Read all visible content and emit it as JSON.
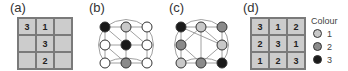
{
  "panels": {
    "a": {
      "label": "(a)",
      "cells": [
        "3",
        "1",
        "",
        "",
        "3",
        "",
        "",
        "2",
        ""
      ]
    },
    "b": {
      "label": "(b)",
      "nodes": [
        "3",
        "1",
        "0",
        "0",
        "3",
        "0",
        "0",
        "2",
        "0"
      ]
    },
    "c": {
      "label": "(c)",
      "nodes": [
        "3",
        "1",
        "2",
        "2",
        "",
        "1",
        "1",
        "2",
        "3"
      ]
    },
    "d": {
      "label": "(d)",
      "cells": [
        "3",
        "1",
        "2",
        "2",
        "3",
        "1",
        "1",
        "2",
        "3"
      ]
    }
  },
  "legend": {
    "title": "Colour",
    "items": [
      {
        "label": "1",
        "color": "#c8c8c8"
      },
      {
        "label": "2",
        "color": "#8a8a8a"
      },
      {
        "label": "3",
        "color": "#1a1a1a"
      }
    ]
  },
  "colors": {
    "empty": "#ffffff",
    "c1": "#c8c8c8",
    "c2": "#8a8a8a",
    "c3": "#1a1a1a"
  }
}
